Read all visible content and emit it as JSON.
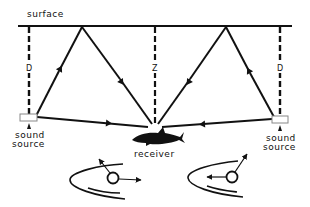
{
  "diagram": {
    "type": "sound-path-schematic",
    "labels": {
      "surface": "surface",
      "left_depth": "D",
      "center_depth": "Z",
      "right_depth": "D",
      "left_source_line1": "sound",
      "left_source_line2": "source",
      "right_source_line1": "sound",
      "right_source_line2": "source",
      "receiver": "receiver"
    },
    "nodes": [
      {
        "id": "left-source",
        "label": "sound source"
      },
      {
        "id": "right-source",
        "label": "sound source"
      },
      {
        "id": "receiver",
        "label": "receiver",
        "icon": "shark-icon"
      },
      {
        "id": "surface-reflection-left"
      },
      {
        "id": "surface-reflection-right"
      }
    ],
    "paths": [
      {
        "from": "left-source",
        "to": "receiver",
        "kind": "direct"
      },
      {
        "from": "right-source",
        "to": "receiver",
        "kind": "direct"
      },
      {
        "from": "left-source",
        "via": "surface-reflection-left",
        "to": "receiver",
        "kind": "surface-reflected"
      },
      {
        "from": "right-source",
        "via": "surface-reflection-right",
        "to": "receiver",
        "kind": "surface-reflected"
      }
    ],
    "insets": [
      {
        "id": "ear-left",
        "description": "inner ear with otolith, arrows pointing up-left and right"
      },
      {
        "id": "ear-right",
        "description": "inner ear with otolith, arrows pointing up-right and left"
      }
    ],
    "colors": {
      "ink": "#111111",
      "background": "#ffffff"
    }
  }
}
